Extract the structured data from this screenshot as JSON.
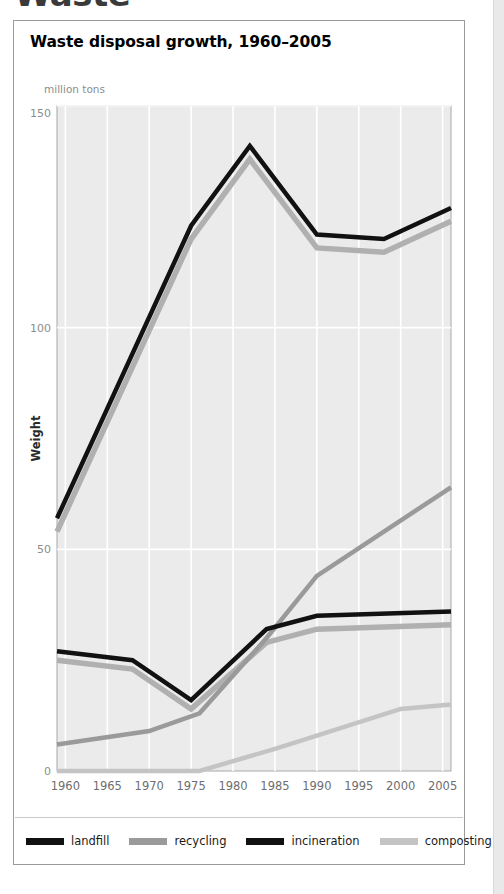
{
  "article": {
    "heading": "Waste"
  },
  "figure": {
    "title": "Waste disposal growth, 1960–2005",
    "unit_label": "million tons"
  },
  "legend": {
    "items": [
      {
        "label": "landfill",
        "color": "#111111"
      },
      {
        "label": "recycling",
        "color": "#9a9a9a"
      },
      {
        "label": "incineration",
        "color": "#111111"
      },
      {
        "label": "composting",
        "color": "#c4c4c4"
      }
    ]
  },
  "chart_data": {
    "type": "line",
    "title": "Waste disposal growth, 1960–2005",
    "xlabel": "",
    "ylabel": "Weight",
    "unit": "million tons",
    "xlim": [
      1959,
      2006
    ],
    "ylim": [
      0,
      150
    ],
    "yticks": [
      0,
      50,
      100,
      150
    ],
    "xticks": [
      1960,
      1965,
      1970,
      1975,
      1980,
      1985,
      1990,
      1995,
      2000,
      2005
    ],
    "grid": true,
    "legend_position": "bottom",
    "plot_background": "#ebebeb",
    "gridline_color": "#ffffff",
    "series": [
      {
        "name": "landfill",
        "color": "#111111",
        "points": [
          {
            "x": 1959,
            "y": 57
          },
          {
            "x": 1975,
            "y": 123
          },
          {
            "x": 1982,
            "y": 141
          },
          {
            "x": 1990,
            "y": 121
          },
          {
            "x": 1998,
            "y": 120
          },
          {
            "x": 2006,
            "y": 127
          }
        ]
      },
      {
        "name": "recycling",
        "color": "#9a9a9a",
        "points": [
          {
            "x": 1959,
            "y": 6
          },
          {
            "x": 1970,
            "y": 9
          },
          {
            "x": 1976,
            "y": 13
          },
          {
            "x": 1984,
            "y": 30
          },
          {
            "x": 1990,
            "y": 44
          },
          {
            "x": 2006,
            "y": 64
          }
        ]
      },
      {
        "name": "incineration",
        "color": "#111111",
        "points": [
          {
            "x": 1959,
            "y": 27
          },
          {
            "x": 1968,
            "y": 25
          },
          {
            "x": 1975,
            "y": 16
          },
          {
            "x": 1984,
            "y": 32
          },
          {
            "x": 1990,
            "y": 35
          },
          {
            "x": 2006,
            "y": 36
          }
        ]
      },
      {
        "name": "composting",
        "color": "#c4c4c4",
        "points": [
          {
            "x": 1959,
            "y": 0
          },
          {
            "x": 1976,
            "y": 0
          },
          {
            "x": 1985,
            "y": 5
          },
          {
            "x": 1990,
            "y": 8
          },
          {
            "x": 2000,
            "y": 14
          },
          {
            "x": 2006,
            "y": 15
          }
        ]
      },
      {
        "name": "landfill-shadow",
        "color": "#b0b0b0",
        "shadow_of": "landfill",
        "points": [
          {
            "x": 1959,
            "y": 54
          },
          {
            "x": 1975,
            "y": 120
          },
          {
            "x": 1982,
            "y": 138
          },
          {
            "x": 1990,
            "y": 118
          },
          {
            "x": 1998,
            "y": 117
          },
          {
            "x": 2006,
            "y": 124
          }
        ]
      },
      {
        "name": "incineration-shadow",
        "color": "#b0b0b0",
        "shadow_of": "incineration",
        "points": [
          {
            "x": 1959,
            "y": 25
          },
          {
            "x": 1968,
            "y": 23
          },
          {
            "x": 1975,
            "y": 14
          },
          {
            "x": 1984,
            "y": 29
          },
          {
            "x": 1990,
            "y": 32
          },
          {
            "x": 2006,
            "y": 33
          }
        ]
      }
    ]
  }
}
